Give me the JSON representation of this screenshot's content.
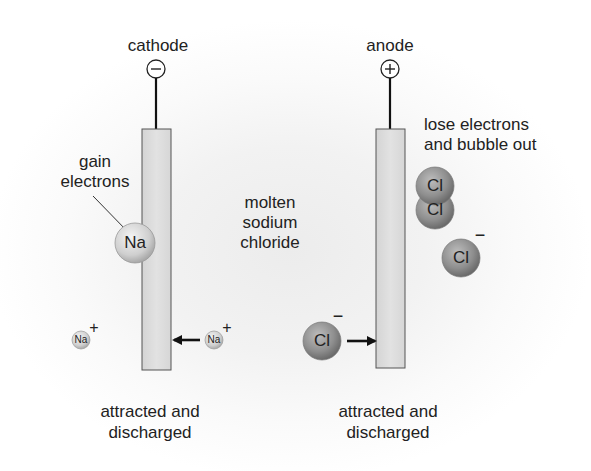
{
  "diagram": {
    "electrolyte_label": [
      "molten",
      "sodium",
      "chloride"
    ],
    "cathode": {
      "label": "cathode",
      "sign": "−",
      "annotation": [
        "gain",
        "electrons"
      ],
      "ion_at_electrode": "Na",
      "bottom_note": [
        "attracted and",
        "discharged"
      ]
    },
    "anode": {
      "label": "anode",
      "sign": "+",
      "annotation": [
        "lose electrons",
        "and bubble out"
      ],
      "molecule": [
        "Cl",
        "Cl"
      ],
      "bottom_note": [
        "attracted and",
        "discharged"
      ]
    },
    "ions": [
      {
        "symbol": "Na",
        "charge": "+",
        "position": "far-left"
      },
      {
        "symbol": "Na",
        "charge": "+",
        "position": "moving-to-cathode"
      },
      {
        "symbol": "Cl",
        "charge": "−",
        "position": "moving-to-anode"
      },
      {
        "symbol": "Cl",
        "charge": "−",
        "position": "right-free"
      }
    ],
    "colors": {
      "electrode_fill": "#dcdcdc",
      "electrode_stroke": "#555555",
      "na_ion": "#cfcfcf",
      "cl_ion": "#8e8e8e",
      "text": "#222222"
    }
  }
}
